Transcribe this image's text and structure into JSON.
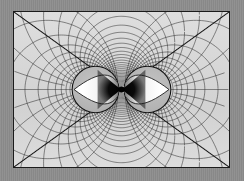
{
  "figure": {
    "kind": "mathematical-field-diagram",
    "background_color": "#8d8d8d",
    "panel_color": "#d9d9d9",
    "frame_color": "#1b1b1b",
    "line_color": "#2a2a2a",
    "accent_highlight_color": "#ffffff",
    "frame": {
      "x": 13,
      "y": 11,
      "width": 217,
      "height": 157
    }
  },
  "chart_data": {
    "type": "line",
    "subtitle": "",
    "xlabel": "",
    "ylabel": "",
    "xlim": [
      -1.0,
      1.0
    ],
    "ylim": [
      -0.724,
      0.724
    ],
    "grid": true,
    "legend_position": "none",
    "tick_labels": {
      "x": [],
      "y": []
    },
    "annotations": [],
    "poles": [
      {
        "name": "left-pole",
        "x": -0.262,
        "y": 0.0
      },
      {
        "name": "right-pole",
        "x": 0.262,
        "y": 0.0
      }
    ],
    "series": [
      {
        "name": "radial-family",
        "role": "field lines through both poles",
        "count": 36,
        "emphasized_members": 4,
        "emphasized_note": "four heavier straight asymptote lines run from the center toward the four frame corners"
      },
      {
        "name": "orthogonal-family",
        "role": "equipotential circles around each pole",
        "count": 34,
        "emphasized_members": 0
      }
    ],
    "markers": [
      {
        "name": "left-circle",
        "center_x": -0.262,
        "center_y": 0.0,
        "radius": 0.236,
        "fill": "#b4b4b4",
        "edge": "#121212"
      },
      {
        "name": "right-circle",
        "center_x": 0.262,
        "center_y": 0.0,
        "radius": 0.236,
        "fill": "#b4b4b4",
        "edge": "#121212"
      },
      {
        "name": "left-crescent",
        "fill": "#ffffff",
        "gradient": "light-to-dark, bright at outer edge fading toward the center node"
      },
      {
        "name": "right-crescent",
        "fill": "#ffffff",
        "gradient": "light-to-dark, bright at outer edge fading toward the center node"
      },
      {
        "name": "center-node",
        "center_x": 0.0,
        "center_y": 0.0,
        "fill": "#000000",
        "shape": "bow-tie / hourglass saddle point"
      }
    ]
  },
  "labels": {
    "panel_label": "",
    "caption": ""
  }
}
